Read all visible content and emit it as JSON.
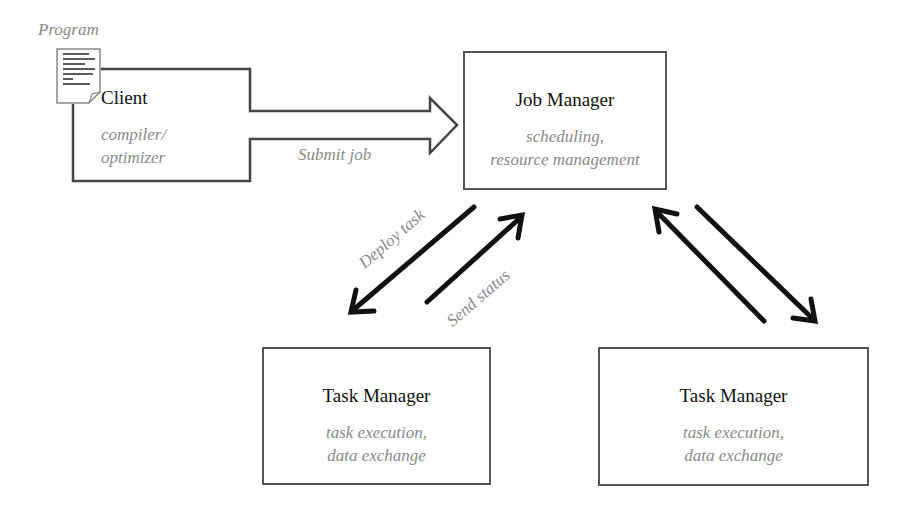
{
  "program": {
    "label": "Program"
  },
  "client": {
    "title": "Client",
    "subtitle_lines": [
      "compiler/",
      "optimizer"
    ]
  },
  "submit": {
    "label": "Submit job"
  },
  "job_manager": {
    "title": "Job Manager",
    "subtitle_lines": [
      "scheduling,",
      "resource management"
    ]
  },
  "deploy": {
    "label": "Deploy task"
  },
  "status": {
    "label": "Send status"
  },
  "task_managers": [
    {
      "title": "Task Manager",
      "subtitle_lines": [
        "task execution,",
        "data exchange"
      ]
    },
    {
      "title": "Task Manager",
      "subtitle_lines": [
        "task execution,",
        "data exchange"
      ]
    }
  ]
}
